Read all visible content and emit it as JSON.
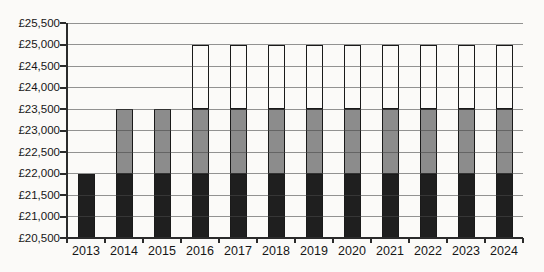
{
  "chart_data": {
    "type": "bar",
    "stacked": true,
    "title": "",
    "xlabel": "",
    "ylabel": "",
    "legend": "none",
    "grid": true,
    "categories": [
      "2013",
      "2014",
      "2015",
      "2016",
      "2017",
      "2018",
      "2019",
      "2020",
      "2021",
      "2022",
      "2023",
      "2024"
    ],
    "baseline": 20500,
    "ylim": [
      20500,
      25500
    ],
    "ytick_step": 500,
    "yticks": [
      {
        "value": 20500,
        "label": "£20,500"
      },
      {
        "value": 21000,
        "label": "£21,000"
      },
      {
        "value": 21500,
        "label": "£21,500"
      },
      {
        "value": 22000,
        "label": "£22,000"
      },
      {
        "value": 22500,
        "label": "£22,500"
      },
      {
        "value": 23000,
        "label": "£23,000"
      },
      {
        "value": 23500,
        "label": "£23,500"
      },
      {
        "value": 24000,
        "label": "£24,000"
      },
      {
        "value": 24500,
        "label": "£24,500"
      },
      {
        "value": 25000,
        "label": "£25,000"
      },
      {
        "value": 25500,
        "label": "£25,500"
      }
    ],
    "series": [
      {
        "name": "band-black",
        "color": "#1f1f1f",
        "fill": "solid",
        "segment_range": [
          20500,
          22000
        ],
        "values": [
          1500,
          1500,
          1500,
          1500,
          1500,
          1500,
          1500,
          1500,
          1500,
          1500,
          1500,
          1500
        ]
      },
      {
        "name": "band-grey",
        "color": "#8c8c8c",
        "fill": "solid",
        "segment_range": [
          22000,
          23500
        ],
        "values": [
          0,
          1500,
          1500,
          1500,
          1500,
          1500,
          1500,
          1500,
          1500,
          1500,
          1500,
          1500
        ]
      },
      {
        "name": "band-white",
        "color": "#ffffff",
        "fill": "outline",
        "segment_range": [
          23500,
          25000
        ],
        "values": [
          0,
          0,
          0,
          1500,
          1500,
          1500,
          1500,
          1500,
          1500,
          1500,
          1500,
          1500
        ]
      }
    ],
    "bar_totals": [
      22000,
      23500,
      23500,
      25000,
      25000,
      25000,
      25000,
      25000,
      25000,
      25000,
      25000,
      25000
    ]
  },
  "styles": {
    "background": "#fbfaf8",
    "grid_color": "#6f6f6f",
    "axis_color": "#2b2b2b",
    "label_color": "#161616",
    "bar_border": "#1a1a1a"
  }
}
